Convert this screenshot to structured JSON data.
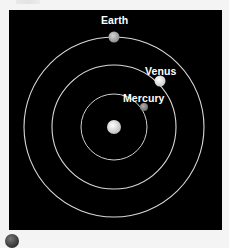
{
  "diagram": {
    "background": "#000000",
    "orbit_color": "#d8d8d8",
    "center": {
      "x": 105,
      "y": 117
    },
    "sun": {
      "name": "Sun",
      "radius": 7,
      "color": "#e8e8e8"
    },
    "orbits": [
      {
        "name": "Mercury orbit",
        "radius": 33
      },
      {
        "name": "Venus orbit",
        "radius": 62
      },
      {
        "name": "Earth orbit",
        "radius": 90
      }
    ],
    "planets": [
      {
        "name": "Earth",
        "label": "Earth",
        "x": 105,
        "y": 27,
        "radius": 5.5,
        "color": "#b8b8b8"
      },
      {
        "name": "Venus",
        "label": "Venus",
        "x": 151,
        "y": 71,
        "radius": 5.5,
        "color": "#eeeeee"
      },
      {
        "name": "Mercury",
        "label": "Mercury",
        "x": 135,
        "y": 97,
        "radius": 4,
        "color": "#999999"
      }
    ]
  },
  "labels": {
    "earth": "Earth",
    "venus": "Venus",
    "mercury": "Mercury"
  }
}
